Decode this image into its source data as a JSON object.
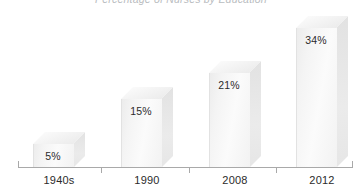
{
  "chart_data": {
    "type": "bar",
    "title": "Percentage of Nurses by Education",
    "subtitle": "",
    "xlabel": "",
    "ylabel": "",
    "categories": [
      "1940s",
      "1990",
      "2008",
      "2012"
    ],
    "values": [
      5,
      15,
      21,
      34
    ],
    "data_labels": [
      "5%",
      "15%",
      "21%",
      "34%"
    ],
    "ylim": [
      0,
      40
    ],
    "grid": false,
    "legend": "none",
    "style": "3d-bars",
    "colors": {
      "bar_front": "#f4f4f4",
      "bar_side": "#e6e6e6",
      "bar_top": "#f6f6f6",
      "axis": "#a9a9a9",
      "label_text": "#2b2b2b",
      "title_text": "#b9bcc0"
    }
  },
  "bars": [
    {
      "label": "1940s",
      "value_label": "5%",
      "value": 5,
      "left": 33,
      "width": 40,
      "height": 24,
      "depth": 12
    },
    {
      "label": "1990",
      "value_label": "15%",
      "value": 15,
      "left": 121,
      "width": 40,
      "height": 69,
      "depth": 12
    },
    {
      "label": "2008",
      "value_label": "21%",
      "value": 21,
      "left": 209,
      "width": 40,
      "height": 95,
      "depth": 12
    },
    {
      "label": "2012",
      "value_label": "34%",
      "value": 34,
      "left": 296,
      "width": 40,
      "height": 140,
      "depth": 12
    }
  ],
  "axis": {
    "ticks": [
      {
        "x": 18
      },
      {
        "x": 101
      },
      {
        "x": 189
      },
      {
        "x": 276
      },
      {
        "x": 352
      }
    ]
  }
}
